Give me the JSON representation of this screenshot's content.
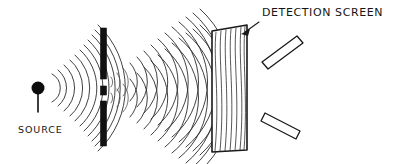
{
  "figure": {
    "background_color": "#ffffff",
    "ink_color": "#151515",
    "width": 401,
    "height": 164
  },
  "labels": {
    "detection_screen": "DETECTION SCREEN",
    "source": "SOURCE"
  },
  "components": {
    "source": {
      "name": "point source",
      "dot_color": "#0d0d0d",
      "x": 38,
      "y": 88,
      "stem_to_y": 112
    },
    "barrier": {
      "name": "double-slit barrier",
      "color": "#111111",
      "x": 101,
      "top": 28,
      "bottom": 146,
      "width": 6,
      "slit_count": 2,
      "segments": [
        {
          "top": 28,
          "bottom": 79
        },
        {
          "top": 86,
          "bottom": 95
        },
        {
          "top": 101,
          "bottom": 146
        }
      ],
      "slits": [
        {
          "top": 79,
          "bottom": 86
        },
        {
          "top": 95,
          "bottom": 101
        }
      ]
    },
    "incident_waves": {
      "name": "circular wavefronts from source",
      "origin_x": 38,
      "origin_y": 88,
      "count": 11,
      "spacing": 7
    },
    "interference_waves": {
      "name": "two-slit interference pattern",
      "sources": [
        {
          "x": 104,
          "y": 82
        },
        {
          "x": 104,
          "y": 98
        }
      ],
      "count": 14,
      "spacing": 7.5
    },
    "detection_screen": {
      "name": "detection screen panel",
      "corners": [
        {
          "x": 212,
          "y": 31
        },
        {
          "x": 247,
          "y": 25
        },
        {
          "x": 247,
          "y": 150
        },
        {
          "x": 212,
          "y": 152
        }
      ],
      "fill": "#ffffff",
      "stroke": "#1a1a1a"
    },
    "detector_bars": [
      {
        "name": "upper detector bar",
        "corners": [
          {
            "x": 262,
            "y": 62
          },
          {
            "x": 297,
            "y": 36
          },
          {
            "x": 303,
            "y": 43
          },
          {
            "x": 268,
            "y": 69
          }
        ]
      },
      {
        "name": "lower detector bar",
        "corners": [
          {
            "x": 265,
            "y": 113
          },
          {
            "x": 300,
            "y": 131
          },
          {
            "x": 296,
            "y": 139
          },
          {
            "x": 261,
            "y": 121
          }
        ]
      }
    ],
    "pointer": {
      "name": "arrow from label to screen",
      "from_x": 258,
      "from_y": 24,
      "to_x": 243,
      "to_y": 33
    }
  }
}
